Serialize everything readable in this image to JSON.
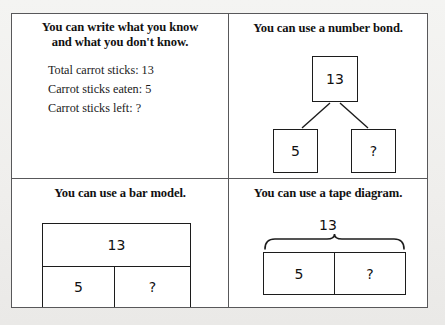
{
  "page": {
    "background_color": "#f2f2f0",
    "frame_border_color": "#58585a",
    "ink_color": "#1c1c1c"
  },
  "quadrants": {
    "write_what_you_know": {
      "heading_line1": "You can write what you know",
      "heading_line2": "and what you don't know.",
      "facts": [
        "Total carrot sticks: 13",
        "Carrot sticks eaten: 5",
        "Carrot sticks left: ?"
      ]
    },
    "number_bond": {
      "heading": "You can use a number bond.",
      "total": "13",
      "part_known": "5",
      "part_unknown": "?"
    },
    "bar_model": {
      "heading": "You can use a bar model.",
      "total": "13",
      "part_known": "5",
      "part_unknown": "?"
    },
    "tape_diagram": {
      "heading": "You can use a tape diagram.",
      "total": "13",
      "part_known": "5",
      "part_unknown": "?"
    }
  }
}
